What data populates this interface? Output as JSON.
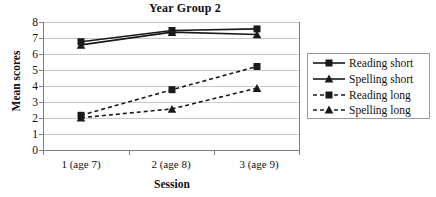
{
  "chart_data": {
    "type": "line",
    "title": "Year Group 2",
    "xlabel": "Session",
    "ylabel": "Mean scores",
    "categories": [
      "1 (age 7)",
      "2 (age 8)",
      "3 (age 9)"
    ],
    "ylim": [
      0,
      8
    ],
    "ytick_labels": [
      "0",
      "1",
      "2",
      "3",
      "4",
      "5",
      "6",
      "7",
      "8"
    ],
    "yticks": [
      0,
      1,
      2,
      3,
      4,
      5,
      6,
      7,
      8
    ],
    "grid": "horizontal",
    "legend_position": "right-outside",
    "series": [
      {
        "name": "Reading short",
        "values": [
          6.8,
          7.5,
          7.6
        ],
        "line_style": "solid",
        "marker": "square",
        "color": "#1a1a1a"
      },
      {
        "name": "Spelling short",
        "values": [
          6.6,
          7.4,
          7.25
        ],
        "line_style": "solid",
        "marker": "triangle",
        "color": "#1a1a1a"
      },
      {
        "name": "Reading long",
        "values": [
          2.2,
          3.8,
          5.25
        ],
        "line_style": "dashed",
        "marker": "square",
        "color": "#1a1a1a"
      },
      {
        "name": "Spelling long",
        "values": [
          2.05,
          2.6,
          3.9
        ],
        "line_style": "dashed",
        "marker": "triangle",
        "color": "#1a1a1a"
      }
    ],
    "colors": {
      "gridline": "#c9c9c9",
      "axis": "#7f7f7f",
      "series": "#1a1a1a",
      "legend_border": "#9a9a9a",
      "background": "#ffffff"
    }
  },
  "legend": {
    "items": [
      {
        "label": "Reading short"
      },
      {
        "label": "Spelling short"
      },
      {
        "label": "Reading long"
      },
      {
        "label": "Spelling long"
      }
    ]
  }
}
